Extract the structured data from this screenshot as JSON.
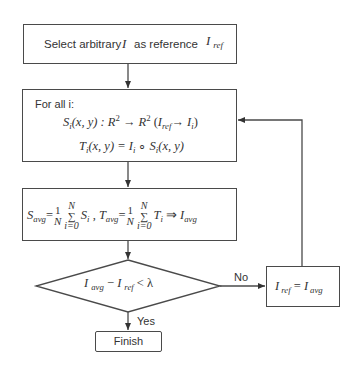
{
  "diagram": {
    "type": "flowchart",
    "stroke_color": "#4a4a4a",
    "background": "#ffffff",
    "nodes": {
      "start": {
        "shape": "rectangle",
        "text_prefix": "Select arbitrary",
        "var_I": "I",
        "text_mid": "as reference",
        "ref_main": "I",
        "ref_sub": "ref"
      },
      "transform": {
        "shape": "rectangle",
        "header": "For all i:",
        "line1": {
          "S": "S",
          "S_sub": "i",
          "args": "(x, y) : ",
          "R1": "R",
          "R1_sup": "2",
          "arrow": " → ",
          "R2": "R",
          "R2_sup": "2",
          "paren_open": "  (",
          "Iref": "I",
          "Iref_sub": "ref",
          "map_arrow": "→ ",
          "Ii": "I",
          "Ii_sub": "i",
          "paren_close": ")"
        },
        "line2": {
          "T": "T",
          "T_sub": "i",
          "args": "(x, y) = ",
          "I": "I",
          "I_sub": "i",
          "compose": " ∘ ",
          "S": "S",
          "S_sub": "i",
          "args2": "(x, y)"
        }
      },
      "average": {
        "shape": "rectangle",
        "S": "S",
        "S_sub": "avg",
        "eq1": "=",
        "frac_num": "1",
        "frac_den": "N",
        "sum_top": "N",
        "sum_sym": "∑",
        "sum_bot": "i=0",
        "Si": "S",
        "Si_sub": "i",
        "sep": " , ",
        "T": "T",
        "T_sub": "avg",
        "eq2": "=",
        "frac2_num": "1",
        "frac2_den": "N",
        "sum2_top": "N",
        "sum2_sym": "∑",
        "sum2_bot": "i=0",
        "Ti": "T",
        "Ti_sub": "i",
        "implies": " ⇒ ",
        "Iavg": "I",
        "Iavg_sub": "avg"
      },
      "decision": {
        "shape": "diamond",
        "I1": "I",
        "I1_sub": "avg",
        "minus": " − ",
        "I2": "I",
        "I2_sub": "ref",
        "lt": " < ",
        "lambda": "λ"
      },
      "update": {
        "shape": "rectangle",
        "I1": "I",
        "I1_sub": "ref",
        "eq": " = ",
        "I2": "I",
        "I2_sub": "avg"
      },
      "finish": {
        "shape": "rectangle",
        "label": "Finish"
      }
    },
    "edges": {
      "no_label": "No",
      "yes_label": "Yes"
    }
  }
}
